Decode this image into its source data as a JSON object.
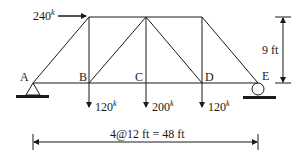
{
  "diagram": {
    "type": "truss",
    "nodes": {
      "A": "A",
      "B": "B",
      "C": "C",
      "D": "D",
      "E": "E"
    },
    "loads": {
      "horizontal": {
        "value": "240",
        "unit": "k",
        "at": "top-left node above B",
        "direction": "right"
      },
      "at_B": {
        "value": "120",
        "unit": "k",
        "direction": "down"
      },
      "at_C": {
        "value": "200",
        "unit": "k",
        "direction": "down"
      },
      "at_D": {
        "value": "120",
        "unit": "k",
        "direction": "down"
      }
    },
    "dimensions": {
      "height": "9 ft",
      "span": "4@12 ft = 48 ft"
    },
    "supports": {
      "A": "pin",
      "E": "roller"
    },
    "colors": {
      "line": "#1a1a1a",
      "background": "#ffffff"
    }
  }
}
